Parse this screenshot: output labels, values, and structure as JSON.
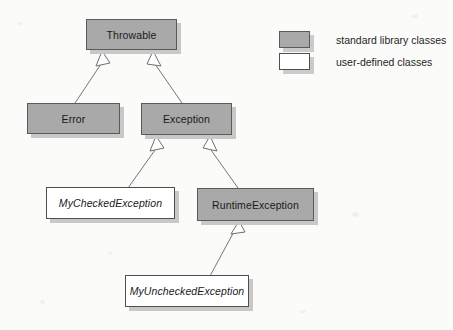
{
  "diagram": {
    "nodes": [
      {
        "id": "throwable",
        "label": "Throwable",
        "kind": "standard"
      },
      {
        "id": "error",
        "label": "Error",
        "kind": "standard"
      },
      {
        "id": "exception",
        "label": "Exception",
        "kind": "standard"
      },
      {
        "id": "my-checked-exception",
        "label": "MyCheckedException",
        "kind": "user"
      },
      {
        "id": "runtime-exception",
        "label": "RuntimeException",
        "kind": "standard"
      },
      {
        "id": "my-unchecked-exception",
        "label": "MyUncheckedException",
        "kind": "user"
      }
    ],
    "edges": [
      {
        "from": "error",
        "to": "throwable",
        "type": "generalization"
      },
      {
        "from": "exception",
        "to": "throwable",
        "type": "generalization"
      },
      {
        "from": "my-checked-exception",
        "to": "exception",
        "type": "generalization"
      },
      {
        "from": "runtime-exception",
        "to": "exception",
        "type": "generalization"
      },
      {
        "from": "my-unchecked-exception",
        "to": "runtime-exception",
        "type": "generalization"
      }
    ]
  },
  "legend": {
    "items": [
      {
        "swatch": "standard-library-swatch",
        "label": "standard library classes"
      },
      {
        "swatch": "user-defined-swatch",
        "label": "user-defined classes"
      }
    ]
  },
  "colors": {
    "standard_fill": "#a9a9a9",
    "user_fill": "#ffffff",
    "border": "#5a5a5a",
    "shadow": "#c9c8c6",
    "connector": "#6f6f6f",
    "background": "#fbfbfa",
    "text": "#1a1a1a"
  }
}
